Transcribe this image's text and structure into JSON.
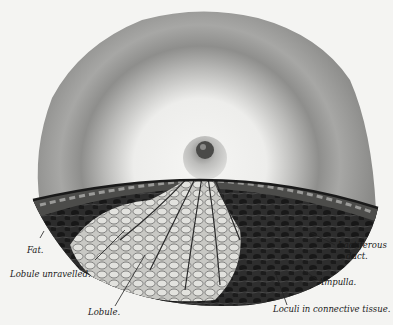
{
  "figure": {
    "labels": {
      "fat": "Fat.",
      "lobule_unravelled": "Lobule unravelled.",
      "lobule": "Lobule.",
      "lactiferous_duct_line1": "Lactiferous",
      "lactiferous_duct_line2": "duct.",
      "ampulla": "Ampulla.",
      "loculi": "Loculi in connective tissue."
    },
    "colors": {
      "background": "#f4f4f2",
      "skin_outer": "#9a9a9a",
      "areola_light": "#e9e9e6",
      "tissue_dark": "#2a2a2a",
      "lobule_light": "#cfcfcb"
    }
  }
}
